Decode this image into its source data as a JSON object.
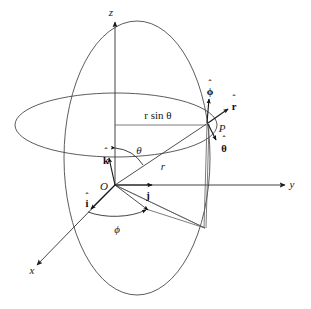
{
  "figure": {
    "background_color": "#ffffff",
    "stroke_color": "#3a3a3a"
  },
  "axes": [
    {
      "name": "z-axis",
      "label": "z",
      "direction": "up"
    },
    {
      "name": "y-axis",
      "label": "y",
      "direction": "right"
    },
    {
      "name": "x-axis",
      "label": "x",
      "direction": "down-left"
    }
  ],
  "points": [
    {
      "name": "origin",
      "label": "O"
    },
    {
      "name": "point-p",
      "label": "P"
    }
  ],
  "lengths": [
    {
      "name": "radius",
      "label": "r"
    },
    {
      "name": "projected-radius",
      "label": "r sin θ"
    }
  ],
  "angles": [
    {
      "name": "polar-angle",
      "label": "θ"
    },
    {
      "name": "azimuthal-angle",
      "label": "ϕ"
    }
  ],
  "cartesian_unit_vectors": [
    {
      "name": "i-hat",
      "label": "i",
      "hat": "ˆ",
      "direction": "along x"
    },
    {
      "name": "j-hat",
      "label": "j",
      "hat": "ˆ",
      "direction": "along y"
    },
    {
      "name": "k-hat",
      "label": "k",
      "hat": "ˆ",
      "direction": "along z"
    }
  ],
  "spherical_unit_vectors": [
    {
      "name": "r-hat",
      "label": "r",
      "hat": "ˆ",
      "direction": "radially outward"
    },
    {
      "name": "theta-hat",
      "label": "θ",
      "hat": "ˆ",
      "direction": "increasing polar angle"
    },
    {
      "name": "phi-hat",
      "label": "ϕ",
      "hat": "ˆ",
      "direction": "increasing azimuth"
    }
  ],
  "curves": [
    {
      "name": "meridian-ellipse",
      "description": "vertical great circle through z-axis and P"
    },
    {
      "name": "parallel-ellipse",
      "description": "horizontal circle of latitude through P"
    }
  ]
}
